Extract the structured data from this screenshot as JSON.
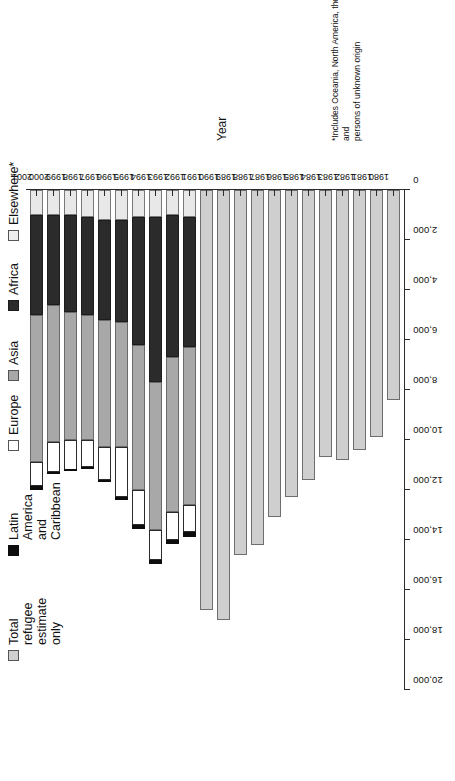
{
  "chart_data": {
    "type": "bar",
    "orientation": "horizontal-stacked",
    "title": "",
    "xlabel": "Estimate of total refugees, in thousands",
    "ylabel": "Year",
    "xlim": [
      0,
      20000
    ],
    "xticks": [
      "0",
      "2,000",
      "4,000",
      "6,000",
      "8,000",
      "10,000",
      "12,000",
      "14,000",
      "16,000",
      "18,000",
      "20,000"
    ],
    "xtick_values": [
      0,
      2000,
      4000,
      6000,
      8000,
      10000,
      12000,
      14000,
      16000,
      18000,
      20000
    ],
    "grid": false,
    "legend_position": "top",
    "categories": [
      "1980",
      "1981",
      "1982",
      "1983",
      "1984",
      "1985",
      "1986",
      "1987",
      "1988",
      "1989",
      "1990",
      "1991",
      "1992",
      "1993",
      "1994",
      "1995",
      "1996",
      "1997",
      "1998",
      "1999",
      "2000",
      "2001"
    ],
    "series": [
      {
        "name": "Total refugee estimate only",
        "color": "#cfcfcf",
        "values": [
          8400,
          9900,
          10400,
          10800,
          10700,
          11600,
          12300,
          13100,
          14200,
          14600,
          17200,
          16800,
          null,
          null,
          null,
          null,
          null,
          null,
          null,
          null,
          null,
          null
        ]
      },
      {
        "name": "Latin America and Caribbean",
        "color": "#0d0d0d",
        "values": [
          null,
          null,
          null,
          null,
          null,
          null,
          null,
          null,
          null,
          null,
          null,
          null,
          200,
          180,
          170,
          150,
          90,
          80,
          70,
          60,
          60,
          160
        ]
      },
      {
        "name": "Europe",
        "color": "#ffffff",
        "values": [
          null,
          null,
          null,
          null,
          null,
          null,
          null,
          null,
          null,
          null,
          null,
          null,
          1100,
          1100,
          1200,
          1400,
          2000,
          1300,
          1100,
          1200,
          1200,
          950
        ]
      },
      {
        "name": "Asia",
        "color": "#a8a8a8",
        "values": [
          null,
          null,
          null,
          null,
          null,
          null,
          null,
          null,
          null,
          null,
          null,
          null,
          6300,
          6200,
          5900,
          5800,
          5000,
          5100,
          5000,
          5100,
          5500,
          5900
        ]
      },
      {
        "name": "Africa",
        "color": "#2b2b2b",
        "values": [
          null,
          null,
          null,
          null,
          null,
          null,
          null,
          null,
          null,
          null,
          null,
          null,
          5200,
          5700,
          6600,
          5100,
          4100,
          4000,
          3900,
          3900,
          3600,
          4000
        ]
      },
      {
        "name": "Elsewhere*",
        "color": "#e8e8e8",
        "values": [
          null,
          null,
          null,
          null,
          null,
          null,
          null,
          null,
          null,
          null,
          null,
          null,
          1100,
          1000,
          1100,
          1100,
          1200,
          1200,
          1100,
          1000,
          1000,
          1000
        ]
      }
    ],
    "totals": [
      8400,
      9900,
      10400,
      10800,
      10700,
      11600,
      12300,
      13100,
      14200,
      14600,
      17200,
      16800,
      13900,
      14180,
      14970,
      13550,
      12390,
      11680,
      11170,
      11260,
      11360,
      12010
    ],
    "note": "Bars for 1980-1991 show the total refugee estimate only; bars for 1992-2001 are broken down by region of origin."
  },
  "legend": {
    "items": [
      {
        "label": "Total refugee estimate only",
        "swatch": "total"
      },
      {
        "label": "Latin America and\nCaribbean",
        "swatch": "latin"
      },
      {
        "label": "Europe",
        "swatch": "europe"
      },
      {
        "label": "Asia",
        "swatch": "asia"
      },
      {
        "label": "Africa",
        "swatch": "africa"
      },
      {
        "label": "Elsewhere*",
        "swatch": "elsewhere"
      }
    ]
  },
  "axes": {
    "x_title": "Estimate of total refugees, in thousands",
    "y_title": "Year"
  },
  "footnote": "*Includes Oceania, North America, the stateless and\npersons of unknown origin"
}
